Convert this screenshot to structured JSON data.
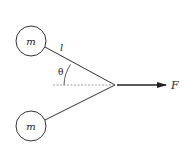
{
  "diagram": {
    "masses": [
      {
        "label": "m",
        "position": "top"
      },
      {
        "label": "m",
        "position": "bottom"
      }
    ],
    "length_label": "l",
    "angle_label": "θ",
    "force_label": "F",
    "colors": {
      "stroke": "#333333",
      "dashed": "#888888",
      "background": "#ffffff"
    }
  }
}
